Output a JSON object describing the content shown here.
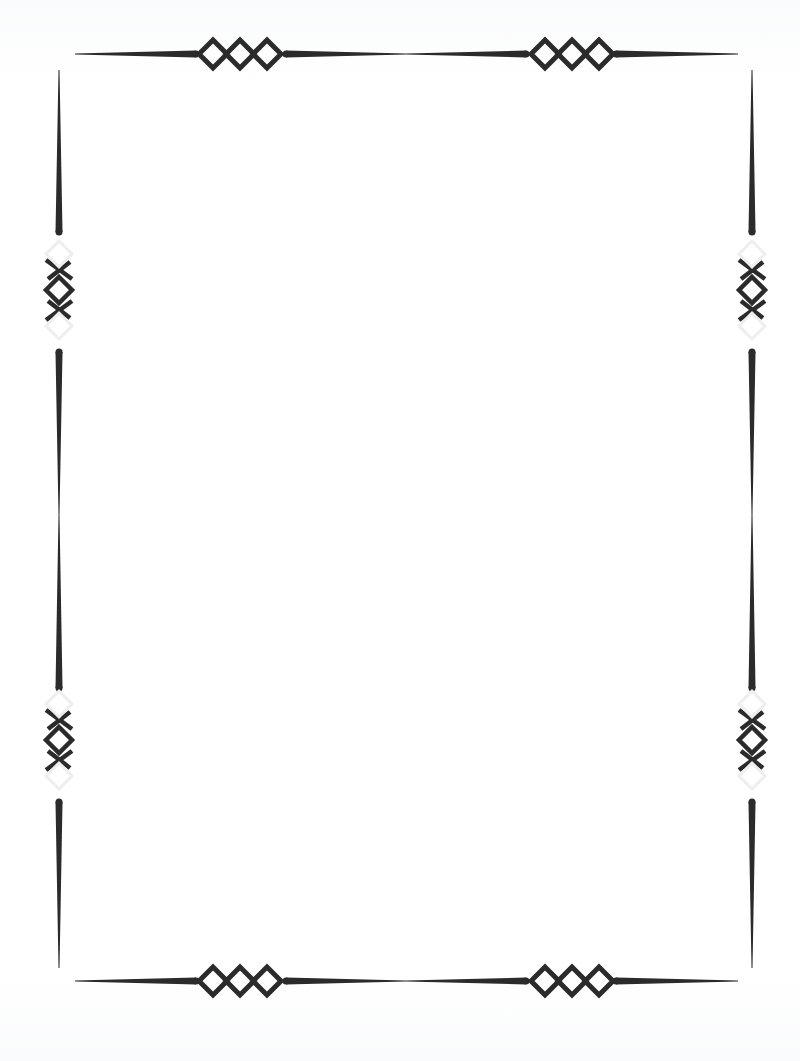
{
  "page": {
    "type": "decorative-border-frame",
    "background": "#ffffff",
    "ink_color": "#2b2b2b",
    "width": 800,
    "height": 1061
  },
  "frame": {
    "top_bar_y": 54,
    "bottom_bar_y": 981,
    "left_bar_x": 59,
    "right_bar_x": 752,
    "horizontal_span": [
      75,
      738
    ],
    "vertical_span": [
      70,
      968
    ],
    "horizontal_ornaments_x": [
      240,
      572
    ],
    "vertical_ornaments_y": [
      290,
      740
    ],
    "ornament": "triple-diamond-chain"
  }
}
